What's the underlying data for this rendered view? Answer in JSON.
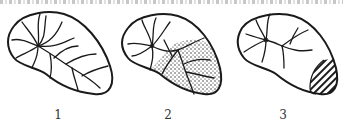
{
  "header": {
    "cropped_text_visible": true
  },
  "figures": [
    {
      "label": "1",
      "fill": "none",
      "description": "veined outline, no affected region"
    },
    {
      "label": "2",
      "fill": "stippled",
      "description": "veined outline with dotted lower-right half"
    },
    {
      "label": "3",
      "fill": "hatched",
      "description": "veined outline with diagonal-hatched tip"
    }
  ],
  "colors": {
    "stroke": "#1a1a1a",
    "background": "#ffffff"
  }
}
